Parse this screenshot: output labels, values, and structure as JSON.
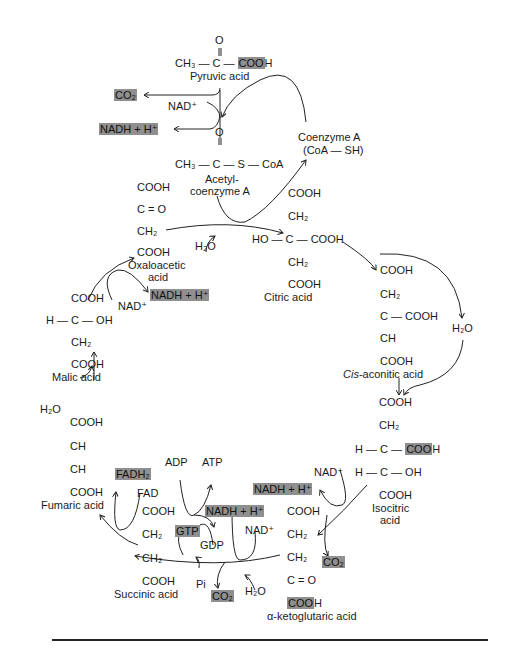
{
  "compounds": {
    "pyruvic": {
      "label": "Pyruvic acid",
      "o": "O",
      "formula_left": "CH₃ — C — ",
      "formula_hl": "COO",
      "formula_right": "H"
    },
    "acetyl_coa": {
      "label_line1": "Acetyl-",
      "label_line2": "coenzyme A",
      "o": "O",
      "formula": "CH₃ — C — S — CoA"
    },
    "coenzyme_a": {
      "label_line1": "Coenzyme A",
      "label_line2": "(CoA — SH)"
    },
    "citric": {
      "label": "Citric acid",
      "lines": [
        "COOH",
        "CH₂",
        "HO — C — COOH",
        "CH₂",
        "COOH"
      ]
    },
    "cis_aconitic": {
      "label": "Cis-aconitic acid",
      "label_italic": "Cis",
      "label_rest": "-aconitic acid",
      "lines": [
        "COOH",
        "CH₂",
        "C — COOH",
        "CH",
        "COOH"
      ]
    },
    "isocitric": {
      "label_line1": "Isocitric",
      "label_line2": "acid",
      "lines": [
        "COOH",
        "CH₂",
        "H — C — ",
        "H — C — OH",
        "COOH"
      ],
      "hl": "COO",
      "hl_rest": "H"
    },
    "alpha_ketoglutaric": {
      "label": "α-ketoglutaric acid",
      "lines": [
        "COOH",
        "CH₂",
        "CH₂",
        "C = O"
      ],
      "hl": "COO",
      "hl_rest": "H"
    },
    "succinic": {
      "label": "Succinic acid",
      "lines": [
        "COOH",
        "CH₂",
        "CH₂",
        "COOH"
      ]
    },
    "fumaric": {
      "label": "Fumaric acid",
      "lines": [
        "COOH",
        "CH",
        "CH",
        "COOH"
      ]
    },
    "malic": {
      "label": "Malic acid",
      "lines": [
        "COOH",
        "H — C — OH",
        "CH₂",
        "COOH"
      ]
    },
    "oxaloacetic": {
      "label_line1": "Oxaloacetic",
      "label_line2": "acid",
      "lines": [
        "COOH",
        "C = O",
        "CH₂",
        "COOH"
      ]
    }
  },
  "cofactors": {
    "co2": "CO₂",
    "nadh": "NADH + H⁺",
    "nad": "NAD⁺",
    "h2o": "H₂O",
    "fadh2": "FADH₂",
    "fad": "FAD",
    "adp": "ADP",
    "atp": "ATP",
    "gtp": "GTP",
    "gdp": "GDP",
    "pi": "Pi"
  },
  "colors": {
    "highlight": "#8f8f8f",
    "line": "#222222"
  }
}
